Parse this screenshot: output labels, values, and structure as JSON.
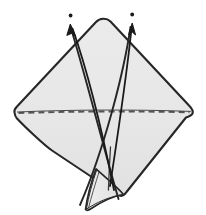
{
  "figure": {
    "name": "origami-fold-diagram",
    "title": "Origami folding step diagram",
    "background_color": "#ffffff",
    "paper_fill": "#e7e7e7",
    "paper_fill_lower": "#e2e2e2",
    "outline_color": "#262626",
    "crease_color": "#3a3a3a",
    "dash_color": "#555555",
    "arrow_color": "#1a1a1a",
    "canvas": {
      "width": 206,
      "height": 215
    }
  },
  "shapes": {
    "diamond": {
      "name": "main-paper-diamond",
      "top_apex": {
        "x": 104,
        "y": 20
      },
      "left_corner": {
        "x": 14,
        "y": 113
      },
      "right_corner": {
        "x": 193,
        "y": 113
      },
      "bottom_apex": {
        "x": 122,
        "y": 196
      },
      "corner_radius": 7
    },
    "fold_line": {
      "name": "horizontal-dashed-fold-line",
      "start": {
        "x": 17,
        "y": 113
      },
      "end": {
        "x": 190,
        "y": 112
      },
      "style": "dashed",
      "dash_pattern": "6 4"
    },
    "bottom_flap": {
      "name": "bottom-pointed-flap",
      "tip": {
        "x": 86,
        "y": 212
      },
      "base_left": {
        "x": 95,
        "y": 170
      },
      "base_right": {
        "x": 124,
        "y": 196
      }
    },
    "center_crease": {
      "name": "vertical-center-crease",
      "start": {
        "x": 110,
        "y": 148
      },
      "end": {
        "x": 108,
        "y": 190
      }
    }
  },
  "arrows": [
    {
      "name": "left-motion-arrow",
      "label": "",
      "tip": {
        "x": 70,
        "y": 25
      },
      "tail": {
        "x": 114,
        "y": 190
      },
      "dot": {
        "x": 71,
        "y": 15
      },
      "head_size": 7,
      "direction": "up-left"
    },
    {
      "name": "right-motion-arrow",
      "label": "",
      "tip": {
        "x": 132,
        "y": 24
      },
      "tail": {
        "x": 110,
        "y": 186
      },
      "dot": {
        "x": 132,
        "y": 14
      },
      "head_size": 7,
      "direction": "up"
    }
  ],
  "creases": [
    {
      "name": "left-diagonal-crease",
      "from": {
        "x": 70,
        "y": 27
      },
      "to": {
        "x": 118,
        "y": 200
      }
    },
    {
      "name": "right-diagonal-crease",
      "from": {
        "x": 130,
        "y": 27
      },
      "to": {
        "x": 79,
        "y": 205
      }
    }
  ]
}
